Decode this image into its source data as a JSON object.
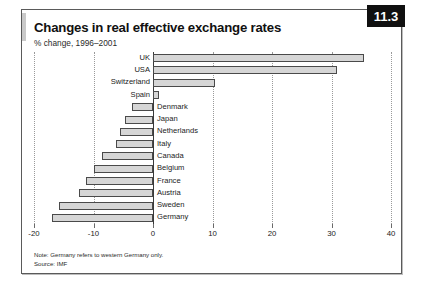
{
  "figure": {
    "badge": "11.3",
    "title": "Changes in real effective exchange rates",
    "subtitle": "% change, 1996–2001",
    "note": "Note: Germany refers to western Germany only.",
    "source": "Source: IMF",
    "bar_fill": "#d6d6d6",
    "bar_stroke": "#4a4a4a",
    "badge_bg": "#101010",
    "badge_fg": "#ffffff"
  },
  "chart_data": {
    "type": "bar",
    "orientation": "horizontal",
    "title": "Changes in real effective exchange rates",
    "subtitle": "% change, 1996–2001",
    "xlabel": "",
    "ylabel": "",
    "xlim": [
      -20,
      40
    ],
    "xticks": [
      -20,
      -10,
      0,
      10,
      20,
      30,
      40
    ],
    "xticklabels": [
      "-20",
      "-10",
      "0",
      "10",
      "20",
      "30",
      "40"
    ],
    "grid": "vertical-dotted",
    "legend": "none",
    "categories": [
      "UK",
      "USA",
      "Switzerland",
      "Spain",
      "Denmark",
      "Japan",
      "Netherlands",
      "Italy",
      "Canada",
      "Belgium",
      "France",
      "Austria",
      "Sweden",
      "Germany"
    ],
    "values": [
      35.5,
      31.0,
      10.5,
      1.0,
      -3.5,
      -4.7,
      -5.6,
      -6.2,
      -8.6,
      -10.0,
      -11.2,
      -12.4,
      -15.8,
      -17.0
    ]
  }
}
